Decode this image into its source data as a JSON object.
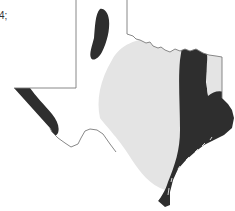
{
  "figure": {
    "type": "shaded-region-map",
    "region": "Texas",
    "label_fragment": "4;",
    "legend": [],
    "zones": [
      {
        "name": "unshaded",
        "color": "#ffffff",
        "description": "West and far-west Texas / panhandle"
      },
      {
        "name": "light",
        "color": "#e4e4e4",
        "description": "Central Texas band"
      },
      {
        "name": "dark",
        "color": "#2e2e2e",
        "description": "East Texas, Gulf Coast, lower Rio Grande, panhandle and far-west patches"
      }
    ],
    "colors": {
      "background": "#ffffff",
      "outline": "#7a7a7a",
      "light_zone": "#e4e4e4",
      "dark_zone": "#2e2e2e"
    }
  }
}
